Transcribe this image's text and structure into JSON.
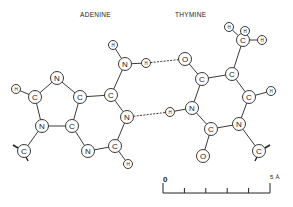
{
  "title_left": "ADENINE",
  "title_right": "THYMINE",
  "colors": {
    "ink": "#222222",
    "background": "#ffffff"
  },
  "atoms": [
    {
      "id": "a_h1",
      "el": "H",
      "x": 113,
      "y": 45,
      "r": 4.5
    },
    {
      "id": "a_n6",
      "el": "N",
      "x": 125,
      "y": 64,
      "r": 6.5
    },
    {
      "id": "a_h2",
      "el": "H",
      "x": 146,
      "y": 63,
      "r": 4.5
    },
    {
      "id": "a_c6",
      "el": "C",
      "x": 111,
      "y": 95,
      "r": 6.5
    },
    {
      "id": "a_c5",
      "el": "C",
      "x": 80,
      "y": 97,
      "r": 6.5
    },
    {
      "id": "a_n7",
      "el": "N",
      "x": 57,
      "y": 78,
      "r": 6.5
    },
    {
      "id": "a_c8",
      "el": "C",
      "x": 35,
      "y": 97,
      "r": 6.5
    },
    {
      "id": "a_h8",
      "el": "H",
      "x": 16,
      "y": 89,
      "r": 4.5
    },
    {
      "id": "a_n9",
      "el": "N",
      "x": 42,
      "y": 126,
      "r": 6.5
    },
    {
      "id": "a_c4",
      "el": "C",
      "x": 72,
      "y": 126,
      "r": 6.5
    },
    {
      "id": "a_n3",
      "el": "N",
      "x": 88,
      "y": 151,
      "r": 6.5
    },
    {
      "id": "a_c2",
      "el": "C",
      "x": 115,
      "y": 146,
      "r": 6.5
    },
    {
      "id": "a_h_c2",
      "el": "H",
      "x": 128,
      "y": 164,
      "r": 4.5
    },
    {
      "id": "a_n1",
      "el": "N",
      "x": 127,
      "y": 117,
      "r": 6.5
    },
    {
      "id": "a_c1p",
      "el": "C",
      "x": 24,
      "y": 151,
      "r": 6.5
    },
    {
      "id": "t_o4",
      "el": "O",
      "x": 185,
      "y": 59,
      "r": 6.5
    },
    {
      "id": "t_c4",
      "el": "C",
      "x": 202,
      "y": 79,
      "r": 6.5
    },
    {
      "id": "t_c5",
      "el": "C",
      "x": 232,
      "y": 74,
      "r": 6.5
    },
    {
      "id": "t_cm",
      "el": "C",
      "x": 243,
      "y": 40,
      "r": 6.5
    },
    {
      "id": "t_hm1",
      "el": "H",
      "x": 229,
      "y": 27,
      "r": 4.5
    },
    {
      "id": "t_hm2",
      "el": "H",
      "x": 245,
      "y": 31,
      "r": 4.5
    },
    {
      "id": "t_hm3",
      "el": "H",
      "x": 262,
      "y": 40,
      "r": 4.5
    },
    {
      "id": "t_c6",
      "el": "C",
      "x": 249,
      "y": 97,
      "r": 6.5
    },
    {
      "id": "t_h6",
      "el": "H",
      "x": 271,
      "y": 91,
      "r": 4.5
    },
    {
      "id": "t_n3",
      "el": "N",
      "x": 192,
      "y": 108,
      "r": 6.5
    },
    {
      "id": "t_h3",
      "el": "H",
      "x": 170,
      "y": 112,
      "r": 4.5
    },
    {
      "id": "t_c2",
      "el": "C",
      "x": 211,
      "y": 129,
      "r": 6.5
    },
    {
      "id": "t_o2",
      "el": "O",
      "x": 203,
      "y": 156,
      "r": 6.5
    },
    {
      "id": "t_n1",
      "el": "N",
      "x": 239,
      "y": 124,
      "r": 6.5
    },
    {
      "id": "t_c1p",
      "el": "C",
      "x": 259,
      "y": 151,
      "r": 6.5
    }
  ],
  "bonds": [
    [
      "a_h1",
      "a_n6"
    ],
    [
      "a_n6",
      "a_h2"
    ],
    [
      "a_n6",
      "a_c6"
    ],
    [
      "a_c6",
      "a_c5"
    ],
    [
      "a_c5",
      "a_n7"
    ],
    [
      "a_n7",
      "a_c8"
    ],
    [
      "a_c8",
      "a_h8"
    ],
    [
      "a_c8",
      "a_n9"
    ],
    [
      "a_n9",
      "a_c4"
    ],
    [
      "a_c4",
      "a_c5"
    ],
    [
      "a_c4",
      "a_n3"
    ],
    [
      "a_n3",
      "a_c2"
    ],
    [
      "a_c2",
      "a_h_c2"
    ],
    [
      "a_c2",
      "a_n1"
    ],
    [
      "a_n1",
      "a_c6"
    ],
    [
      "a_n9",
      "a_c1p"
    ],
    [
      "t_o4",
      "t_c4"
    ],
    [
      "t_c4",
      "t_c5"
    ],
    [
      "t_c5",
      "t_cm"
    ],
    [
      "t_cm",
      "t_hm1"
    ],
    [
      "t_cm",
      "t_hm2"
    ],
    [
      "t_cm",
      "t_hm3"
    ],
    [
      "t_c5",
      "t_c6"
    ],
    [
      "t_c6",
      "t_h6"
    ],
    [
      "t_c6",
      "t_n1"
    ],
    [
      "t_c4",
      "t_n3"
    ],
    [
      "t_n3",
      "t_h3"
    ],
    [
      "t_n3",
      "t_c2"
    ],
    [
      "t_c2",
      "t_n1"
    ],
    [
      "t_c2",
      "t_o2"
    ],
    [
      "t_n1",
      "t_c1p"
    ]
  ],
  "hydrogen_bonds": [
    [
      "a_h2",
      "t_o4"
    ],
    [
      "a_n1",
      "t_h3"
    ]
  ],
  "scale_bar": {
    "start_label": "0",
    "end_label": "5 Å",
    "x0": 163,
    "x1": 270,
    "y": 193,
    "ticks": 5
  }
}
